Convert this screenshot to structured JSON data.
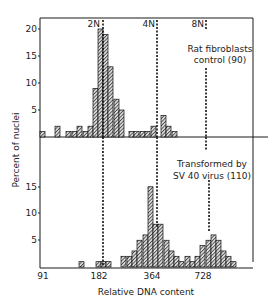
{
  "chart_data": [
    {
      "type": "bar",
      "panel": "top",
      "title": "Rat fibroblasts control (90)",
      "annotation_lines": "Rat fibroblasts",
      "annotation_line2": "control (90)",
      "xlabel": "Relative DNA content",
      "ylabel": "Percent of nuclei",
      "ylim": [
        0,
        20
      ],
      "yticks": [
        5,
        10,
        15,
        20
      ],
      "bin_x_px": [
        40,
        55,
        66,
        72,
        77,
        83,
        88,
        93,
        98,
        103,
        108,
        114,
        119,
        129,
        134,
        140,
        145,
        151,
        161,
        166,
        172
      ],
      "values": [
        1,
        2,
        1,
        1,
        2,
        1,
        2,
        9,
        20,
        19,
        13,
        7,
        5,
        1,
        1,
        1,
        1,
        2,
        4,
        2,
        1
      ]
    },
    {
      "type": "bar",
      "panel": "bottom",
      "title": "Transformed by SV 40 virus (110)",
      "annotation_line1": "Transformed by",
      "annotation_line2": "SV 40 virus (110)",
      "xlabel": "Relative DNA content",
      "ylabel": "Percent of nuclei",
      "ylim": [
        0,
        20
      ],
      "yticks": [
        5,
        10,
        15
      ],
      "bin_x_px": [
        79,
        96,
        101,
        106,
        121,
        127,
        132,
        137,
        143,
        148,
        153,
        158,
        164,
        169,
        174,
        179,
        185,
        190,
        195,
        200,
        206,
        211,
        216,
        221,
        226,
        231
      ],
      "values": [
        1,
        1,
        1,
        1,
        2,
        2,
        3,
        5,
        6,
        15,
        8,
        8,
        5,
        3,
        2,
        1,
        2,
        1,
        2,
        4,
        5,
        6,
        5,
        3,
        2,
        1
      ]
    }
  ],
  "axis": {
    "x_ticks": [
      "91",
      "182",
      "364",
      "728"
    ],
    "xlabel": "Relative DNA content",
    "ylabel": "Percent of nuclei",
    "top_yticks": [
      "5",
      "10",
      "15",
      "20"
    ],
    "bottom_yticks": [
      "5",
      "10",
      "15"
    ]
  },
  "markers": [
    "2N",
    "4N",
    "8N"
  ],
  "colors": {
    "ink": "#1a1a1a",
    "bar_fill": "#555555",
    "background": "#ffffff"
  }
}
